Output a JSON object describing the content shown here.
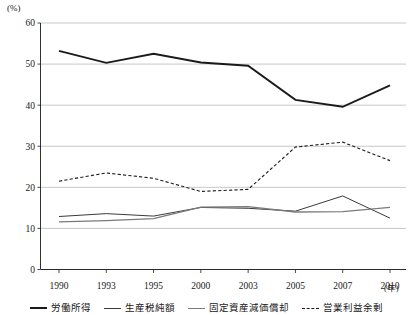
{
  "chart_data": {
    "type": "line",
    "title": "",
    "xlabel": "年",
    "ylabel": "(%)",
    "ylim": [
      0,
      60
    ],
    "yticks": [
      0,
      10,
      20,
      30,
      40,
      50,
      60
    ],
    "grid": true,
    "legend_position": "bottom",
    "categories": [
      "1990",
      "1993",
      "1995",
      "2000",
      "2003",
      "2005",
      "2007",
      "2010"
    ],
    "series": [
      {
        "name": "労働所得",
        "style": "solid",
        "color": "#1a1a1a",
        "width": 1.9,
        "values": [
          53.2,
          50.3,
          52.5,
          50.4,
          49.6,
          41.3,
          39.6,
          44.8
        ]
      },
      {
        "name": "生産税純額",
        "style": "solid",
        "color": "#3a3a3a",
        "width": 1.0,
        "values": [
          12.9,
          13.6,
          13.0,
          15.1,
          14.9,
          14.2,
          17.9,
          12.5
        ]
      },
      {
        "name": "固定資産減価償却",
        "style": "solid",
        "color": "#7a7a7a",
        "width": 1.3,
        "values": [
          11.6,
          11.9,
          12.4,
          15.2,
          15.3,
          14.0,
          14.1,
          15.1
        ]
      },
      {
        "name": "営業利益余剰",
        "style": "dashed",
        "color": "#1a1a1a",
        "width": 1.1,
        "values": [
          21.5,
          23.5,
          22.2,
          19.0,
          19.5,
          29.8,
          31.0,
          26.5
        ]
      }
    ]
  },
  "axis": {
    "unit_label": "(%)",
    "x_unit_label": "(年)",
    "y_tick_labels": [
      "60",
      "50",
      "40",
      "30",
      "20",
      "10",
      "0"
    ],
    "x_tick_labels": [
      "1990",
      "1993",
      "1995",
      "2000",
      "2003",
      "2005",
      "2007",
      "2010"
    ]
  },
  "legend": {
    "items": [
      {
        "label": "労働所得",
        "color": "#1a1a1a",
        "style": "solid",
        "width": 2.4
      },
      {
        "label": "生産税純額",
        "color": "#3a3a3a",
        "style": "solid",
        "width": 1.3
      },
      {
        "label": "固定資産減価償却",
        "color": "#7a7a7a",
        "style": "solid",
        "width": 1.6
      },
      {
        "label": "営業利益余剰",
        "color": "#1a1a1a",
        "style": "dashed",
        "width": 1.3
      }
    ]
  }
}
